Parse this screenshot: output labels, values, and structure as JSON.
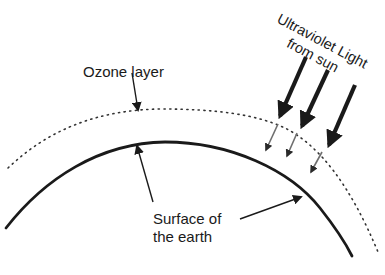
{
  "diagram": {
    "type": "labeled-illustration",
    "labels": {
      "ozone_layer": "Ozone layer",
      "uv_line1": "Ultraviolet Light",
      "uv_line2": "from sun",
      "surface_line1": "Surface of",
      "surface_line2": "the earth"
    },
    "elements": {
      "earth_surface": "solid black arc",
      "ozone_layer": "dotted arc above the earth surface",
      "uv_arrows": {
        "count": 3,
        "style": "thick black arrow above ozone layer, thin gray arrow below ozone layer"
      }
    },
    "colors": {
      "line": "#1a1a1a",
      "filtered_ray": "#6e6e6e",
      "background": "#ffffff"
    }
  }
}
